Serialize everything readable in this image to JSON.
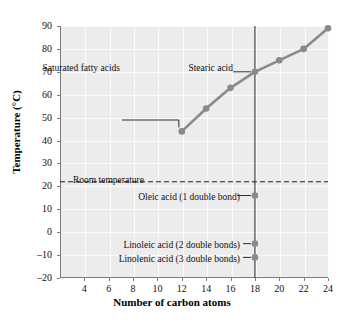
{
  "chart_data": {
    "type": "line",
    "title": "",
    "xlabel": "Number of carbon atoms",
    "ylabel": "Temperature (°C)",
    "xlim": [
      2,
      24
    ],
    "ylim": [
      -20,
      90
    ],
    "grid": true,
    "legend": "none",
    "xticks": [
      4,
      6,
      8,
      10,
      12,
      14,
      16,
      18,
      20,
      22,
      24
    ],
    "yticks": [
      -20,
      -10,
      0,
      10,
      20,
      30,
      40,
      50,
      60,
      70,
      80,
      90
    ],
    "series": [
      {
        "name": "Saturated fatty acids",
        "color": "#8a8a8a",
        "x": [
          12,
          14,
          16,
          18,
          20,
          22,
          24
        ],
        "values": [
          44,
          54,
          63,
          70,
          75,
          80,
          89
        ]
      },
      {
        "name": "Unsaturated fatty acids (18 carbons)",
        "color": "#8a8a8a",
        "x": [
          18,
          18,
          18
        ],
        "values": [
          16,
          -5,
          -11
        ]
      }
    ],
    "reference_lines": [
      {
        "name": "Room temperature",
        "orientation": "horizontal",
        "value": 22,
        "style": "dashed"
      },
      {
        "name": "Eighteen carbon atoms",
        "orientation": "vertical",
        "value": 18,
        "style": "solid"
      }
    ],
    "annotations": [
      {
        "label": "Stearic acid",
        "x": 18,
        "y": 70
      },
      {
        "label": "Saturated fatty acids",
        "x": 12,
        "y": 44
      },
      {
        "label": "Room temperature",
        "x": 5.4,
        "y": 22
      },
      {
        "label": "Oleic acid (1 double bond)",
        "x": 18,
        "y": 16
      },
      {
        "label": "Linoleic acid (2 double bonds)",
        "x": 18,
        "y": -5
      },
      {
        "label": "Linolenic acid (3 double bonds)",
        "x": 18,
        "y": -11
      }
    ]
  },
  "axes": {
    "x_title": "Number of carbon atoms",
    "y_title": "Temperature (°C)",
    "x_tick_labels": [
      "4",
      "6",
      "8",
      "10",
      "12",
      "14",
      "16",
      "18",
      "20",
      "22",
      "24"
    ],
    "y_tick_labels": [
      "90",
      "80",
      "70",
      "60",
      "50",
      "40",
      "30",
      "20",
      "10",
      "0",
      "–10",
      "–20"
    ]
  },
  "labels": {
    "stearic_acid": "Stearic acid",
    "saturated_fatty_acids": "Saturated fatty acids",
    "room_temperature": "Room temperature",
    "oleic_acid": "Oleic acid (1 double bond)",
    "linoleic_acid": "Linoleic acid (2 double bonds)",
    "linolenic_acid": "Linolenic acid (3 double bonds)"
  },
  "colors": {
    "plot_background": "#ececec",
    "gridline": "#fbfbfb",
    "axis": "#7d7d7d",
    "series": "#8a8a8a",
    "text": "#111111"
  }
}
